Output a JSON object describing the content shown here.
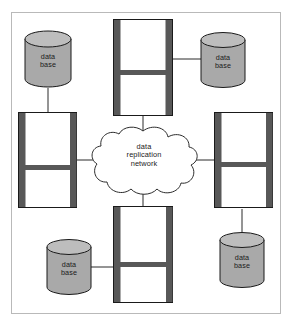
{
  "diagram": {
    "frame": {
      "border_color": "#b9b9b9",
      "background": "#ffffff"
    },
    "palette": {
      "cylinder_fill": "#a9a9a9",
      "cylinder_top_fill": "#bdbdbd",
      "outline": "#1a1a1a",
      "server_bar": "#585858",
      "server_fill": "#ffffff",
      "cloud_fill": "#ffffff",
      "link": "#2b2b2b",
      "text": "#1a1a1a"
    },
    "center": {
      "name": "data-replication-network-cloud",
      "shape": "cloud",
      "label_lines": [
        "data",
        "replication",
        "network"
      ],
      "label": "data\nreplication\nnetwork"
    },
    "servers": [
      {
        "id": "server-top",
        "position": "top",
        "label": ""
      },
      {
        "id": "server-left",
        "position": "left",
        "label": ""
      },
      {
        "id": "server-right",
        "position": "right",
        "label": ""
      },
      {
        "id": "server-bottom",
        "position": "bottom",
        "label": ""
      }
    ],
    "databases": [
      {
        "id": "database-top-left",
        "position": "top-left",
        "label": "data\nbase",
        "label_lines": [
          "data",
          "base"
        ],
        "connects_to": "server-left"
      },
      {
        "id": "database-top-right",
        "position": "top-right",
        "label": "data\nbase",
        "label_lines": [
          "data",
          "base"
        ],
        "connects_to": "server-top"
      },
      {
        "id": "database-bottom-right",
        "position": "bottom-right",
        "label": "data\nbase",
        "label_lines": [
          "data",
          "base"
        ],
        "connects_to": "server-right"
      },
      {
        "id": "database-bottom-left",
        "position": "bottom-left",
        "label": "data\nbase",
        "label_lines": [
          "data",
          "base"
        ],
        "connects_to": "server-bottom"
      }
    ],
    "links": [
      {
        "id": "link-server-top-to-cloud",
        "from": "server-top",
        "to": "data-replication-network-cloud"
      },
      {
        "id": "link-server-left-to-cloud",
        "from": "server-left",
        "to": "data-replication-network-cloud"
      },
      {
        "id": "link-server-right-to-cloud",
        "from": "server-right",
        "to": "data-replication-network-cloud"
      },
      {
        "id": "link-server-bottom-to-cloud",
        "from": "server-bottom",
        "to": "data-replication-network-cloud"
      },
      {
        "id": "link-db-top-left-to-server-left",
        "from": "database-top-left",
        "to": "server-left"
      },
      {
        "id": "link-db-top-right-to-server-top",
        "from": "database-top-right",
        "to": "server-top"
      },
      {
        "id": "link-db-bottom-right-to-server-right",
        "from": "database-bottom-right",
        "to": "server-right"
      },
      {
        "id": "link-db-bottom-left-to-server-bottom",
        "from": "database-bottom-left",
        "to": "server-bottom"
      }
    ]
  }
}
